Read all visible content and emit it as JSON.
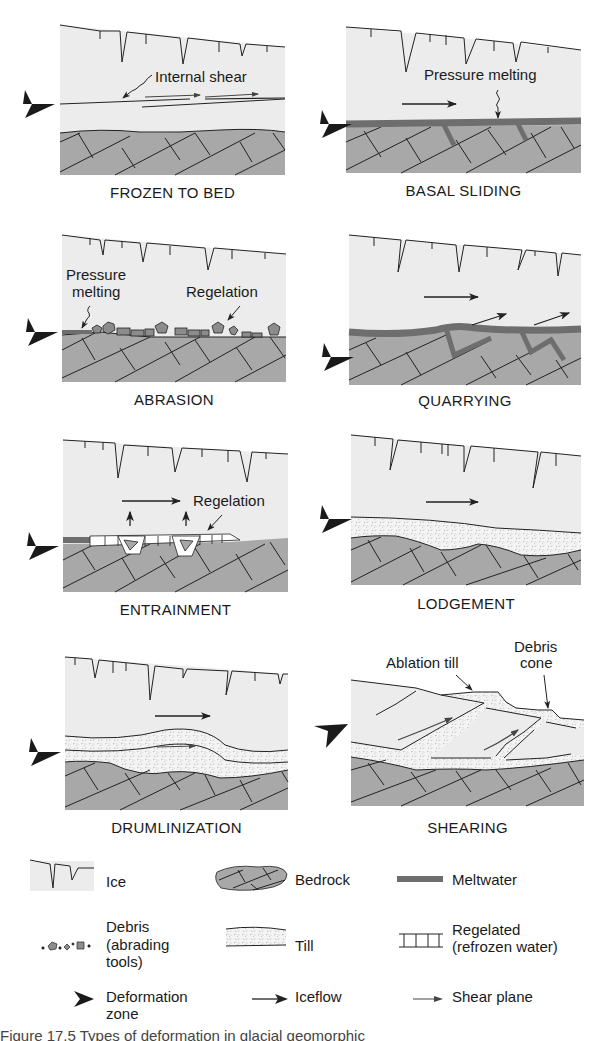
{
  "figure": {
    "panels": [
      {
        "id": "frozen-to-bed",
        "title": "FROZEN TO BED",
        "labels": [
          "Internal shear"
        ]
      },
      {
        "id": "basal-sliding",
        "title": "BASAL SLIDING",
        "labels": [
          "Pressure melting"
        ]
      },
      {
        "id": "abrasion",
        "title": "ABRASION",
        "labels": [
          "Pressure",
          "melting",
          "Regelation"
        ]
      },
      {
        "id": "quarrying",
        "title": "QUARRYING",
        "labels": []
      },
      {
        "id": "entrainment",
        "title": "ENTRAINMENT",
        "labels": [
          "Regelation"
        ]
      },
      {
        "id": "lodgement",
        "title": "LODGEMENT",
        "labels": []
      },
      {
        "id": "drumlinization",
        "title": "DRUMLINIZATION",
        "labels": []
      },
      {
        "id": "shearing",
        "title": "SHEARING",
        "labels": [
          "Ablation till",
          "Debris",
          "cone"
        ]
      }
    ],
    "legend": [
      {
        "symbol": "ice-icon",
        "lines": [
          "Ice"
        ]
      },
      {
        "symbol": "bedrock-icon",
        "lines": [
          "Bedrock"
        ]
      },
      {
        "symbol": "meltwater-icon",
        "lines": [
          "Meltwater"
        ]
      },
      {
        "symbol": "debris-icon",
        "lines": [
          "Debris",
          "(abrading",
          "tools)"
        ]
      },
      {
        "symbol": "till-icon",
        "lines": [
          "Till"
        ]
      },
      {
        "symbol": "regelated-icon",
        "lines": [
          "Regelated",
          "(refrozen water)"
        ]
      },
      {
        "symbol": "deformation-zone-icon",
        "lines": [
          "Deformation",
          "zone"
        ]
      },
      {
        "symbol": "iceflow-arrow-icon",
        "lines": [
          "Iceflow"
        ]
      },
      {
        "symbol": "shear-plane-arrow-icon",
        "lines": [
          "Shear plane"
        ]
      }
    ],
    "caption_partial": "Figure 17.5 Types of deformation in glacial geomorphic",
    "colors": {
      "ice": "#ececec",
      "bedrock": "#a8a8a8",
      "meltwater": "#6e6e6e",
      "till": "#f4f4f4",
      "line": "#222222",
      "arrowhead": "#1a1a1a"
    }
  }
}
